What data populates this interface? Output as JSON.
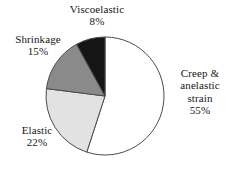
{
  "chart_data": {
    "type": "pie",
    "title": "",
    "legend_position": "outside-labels",
    "grid": false,
    "start_angle_deg": 0,
    "direction": "clockwise",
    "units": "%",
    "categories": [
      "Creep & anelastic strain",
      "Elastic",
      "Shrinkage",
      "Viscoelastic"
    ],
    "values": [
      55,
      22,
      15,
      8
    ],
    "value_labels": [
      "55%",
      "22%",
      "15%",
      "8%"
    ],
    "colors": [
      "#ffffff",
      "#e2e2e2",
      "#8a8a8a",
      "#151515"
    ],
    "slices": [
      {
        "name": "Creep & anelastic strain",
        "name_lines": [
          "Creep &",
          "anelastic",
          "strain"
        ],
        "value": 55,
        "value_label": "55%",
        "color": "#ffffff",
        "start_deg": 0,
        "end_deg": 198
      },
      {
        "name": "Elastic",
        "name_lines": [
          "Elastic"
        ],
        "value": 22,
        "value_label": "22%",
        "color": "#e2e2e2",
        "start_deg": 198,
        "end_deg": 277.2
      },
      {
        "name": "Shrinkage",
        "name_lines": [
          "Shrinkage"
        ],
        "value": 15,
        "value_label": "15%",
        "color": "#8a8a8a",
        "start_deg": 277.2,
        "end_deg": 331.2
      },
      {
        "name": "Viscoelastic",
        "name_lines": [
          "Viscoelastic"
        ],
        "value": 8,
        "value_label": "8%",
        "color": "#151515",
        "start_deg": 331.2,
        "end_deg": 360
      }
    ],
    "geometry": {
      "center_x": 105,
      "center_y": 96,
      "radius": 59,
      "outline_color": "#4a4a4a",
      "outline_width": 1
    }
  },
  "labels": {
    "creep": {
      "line1": "Creep &",
      "line2": "anelastic",
      "line3": "strain",
      "value": "55%"
    },
    "elastic": {
      "name": "Elastic",
      "value": "22%"
    },
    "shrinkage": {
      "name": "Shrinkage",
      "value": "15%"
    },
    "viscoelastic": {
      "name": "Viscoelastic",
      "value": "8%"
    }
  }
}
